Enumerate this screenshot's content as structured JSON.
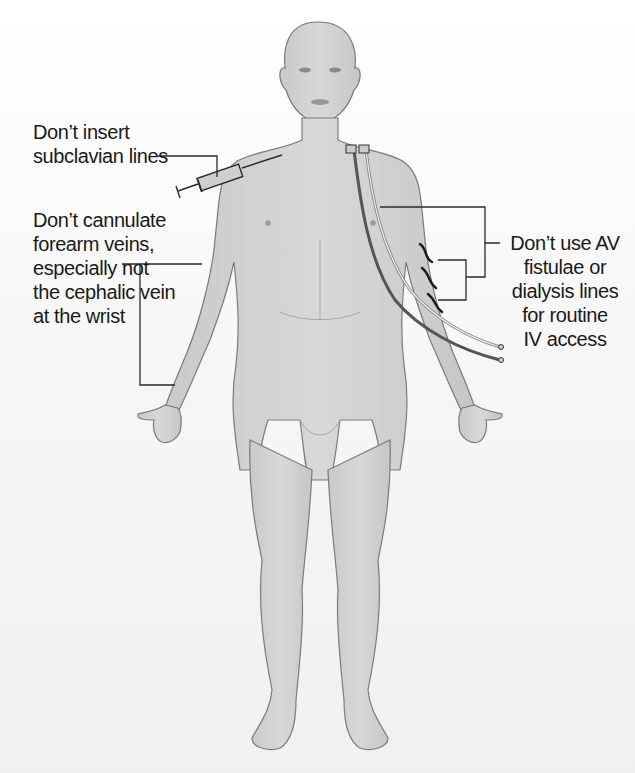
{
  "labels": {
    "subclavian": {
      "lines": [
        "Don’t insert",
        "subclavian lines"
      ]
    },
    "forearm": {
      "lines": [
        "Don’t cannulate",
        "forearm veins,",
        "especially not",
        "the cephalic vein",
        "at the wrist"
      ]
    },
    "av_fistulae": {
      "lines": [
        "Don’t use AV",
        "fistulae or",
        "dialysis lines",
        "for routine",
        "IV access"
      ]
    }
  },
  "colors": {
    "skin": "#d2d2d2",
    "skin_shade": "#bdbdbd",
    "outline": "#7a7a7a",
    "text": "#1a1a1a",
    "leader_line": "#2a2a2a",
    "catheter_dark": "#555555",
    "catheter_light": "#e8e8e8"
  }
}
